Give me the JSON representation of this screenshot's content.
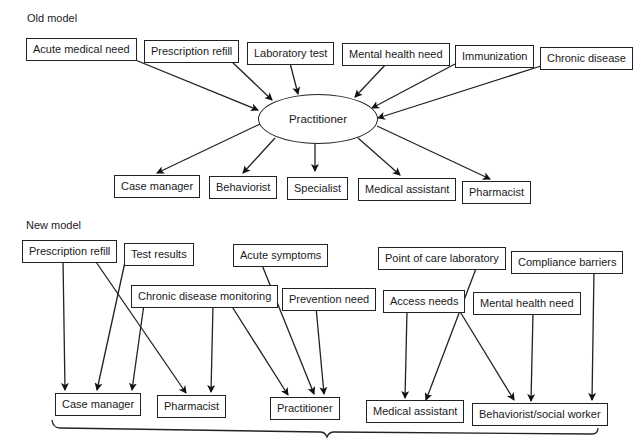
{
  "old_model": {
    "label": "Old model",
    "center": "Practitioner",
    "inputs": [
      "Acute medical need",
      "Prescription refill",
      "Laboratory test",
      "Mental health need",
      "Immunization",
      "Chronic disease"
    ],
    "outputs": [
      "Case manager",
      "Behaviorist",
      "Specialist",
      "Medical assistant",
      "Pharmacist"
    ]
  },
  "new_model": {
    "label": "New model",
    "inputs": [
      "Prescription refill",
      "Test results",
      "Chronic disease monitoring",
      "Acute symptoms",
      "Prevention need",
      "Point of care laboratory",
      "Access needs",
      "Mental health need",
      "Compliance barriers"
    ],
    "outputs": [
      "Case manager",
      "Pharmacist",
      "Practitioner",
      "Medical assistant",
      "Behaviorist/social worker"
    ],
    "connections": [
      {
        "from": "Prescription refill",
        "to": "Case manager"
      },
      {
        "from": "Prescription refill",
        "to": "Pharmacist"
      },
      {
        "from": "Test results",
        "to": "Case manager"
      },
      {
        "from": "Chronic disease monitoring",
        "to": "Case manager"
      },
      {
        "from": "Chronic disease monitoring",
        "to": "Pharmacist"
      },
      {
        "from": "Chronic disease monitoring",
        "to": "Practitioner"
      },
      {
        "from": "Acute symptoms",
        "to": "Practitioner"
      },
      {
        "from": "Prevention need",
        "to": "Practitioner"
      },
      {
        "from": "Point of care laboratory",
        "to": "Medical assistant"
      },
      {
        "from": "Access needs",
        "to": "Medical assistant"
      },
      {
        "from": "Access needs",
        "to": "Behaviorist/social worker"
      },
      {
        "from": "Mental health need",
        "to": "Behaviorist/social worker"
      },
      {
        "from": "Compliance barriers",
        "to": "Behaviorist/social worker"
      }
    ]
  }
}
